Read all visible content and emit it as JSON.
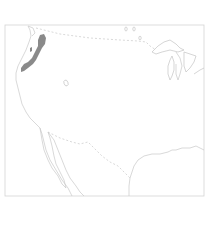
{
  "map": {
    "type": "range-map",
    "region": "Western and Central United States",
    "colors": {
      "background": "#ffffff",
      "outline": "#c8c8c8",
      "range_fill": "#8a8a8a"
    },
    "features": {
      "frame": "map-frame",
      "coastline": "pacific-coastline",
      "borders": [
        "us-canada-border",
        "us-mexico-border"
      ],
      "lakes": [
        "great-lakes",
        "great-salt-lake"
      ],
      "shaded_range": "pacific-northwest-range"
    }
  }
}
